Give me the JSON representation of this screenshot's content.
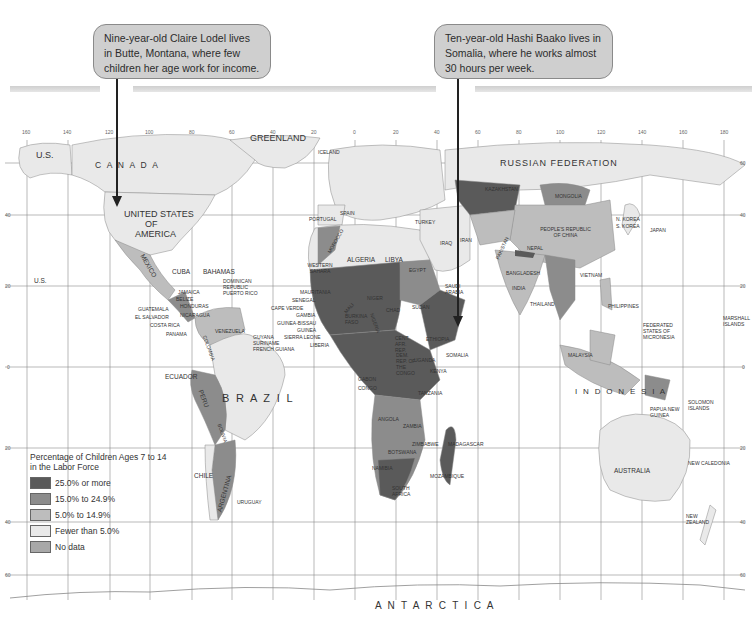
{
  "callouts": [
    {
      "text": "Nine-year-old Claire Lodel lives in Butte, Montana, where few children her age work for income.",
      "points_to": "United States of America"
    },
    {
      "text": "Ten-year-old Hashi Baako lives in Somalia, where he works almost 30 hours per week.",
      "points_to": "Somalia"
    }
  ],
  "legend": {
    "title": "Percentage of Children Ages 7 to 14 in the Labor Force",
    "items": [
      {
        "label": "25.0% or more",
        "color": "#5a5a5a"
      },
      {
        "label": "15.0% to 24.9%",
        "color": "#8c8c8c"
      },
      {
        "label": "5.0% to 14.9%",
        "color": "#bdbdbd"
      },
      {
        "label": "Fewer than 5.0%",
        "color": "#e9e9e9"
      },
      {
        "label": "No data",
        "color": "#a8a8a8"
      }
    ]
  },
  "grid": {
    "longitude_ticks": [
      "160",
      "140",
      "120",
      "100",
      "80",
      "60",
      "40",
      "20",
      "0",
      "20",
      "40",
      "60",
      "80",
      "100",
      "120",
      "140",
      "160",
      "180"
    ],
    "latitude_ticks_right": [
      "60",
      "40",
      "20",
      "0",
      "20",
      "40",
      "60"
    ],
    "latitude_ticks_left": [
      "40",
      "20",
      "0",
      "20",
      "40",
      "60"
    ]
  },
  "labels": {
    "us_alaska": "U.S.",
    "canada": "C A N A D A",
    "greenland": "GREENLAND",
    "iceland": "ICELAND",
    "usa_1": "UNITED STATES",
    "usa_2": "OF",
    "usa_3": "AMERICA",
    "mexico": "MEXICO",
    "us_hawaii": "U.S.",
    "cuba": "CUBA",
    "bahamas": "BAHAMAS",
    "dominican": "DOMINICAN REPUBLIC",
    "puerto_rico": "PUERTO RICO",
    "jamaica": "JAMAICA",
    "belize": "BELIZE",
    "honduras": "HONDURAS",
    "guatemala": "GUATEMALA",
    "el_salvador": "EL SALVADOR",
    "nicaragua": "NICARAGUA",
    "costa_rica": "COSTA RICA",
    "panama": "PANAMA",
    "venezuela": "VENEZUELA",
    "guyana": "GUYANA",
    "suriname": "SURINAME",
    "french_guiana": "FRENCH GUIANA",
    "colombia": "COLOMBIA",
    "ecuador": "ECUADOR",
    "brazil": "B R A Z I L",
    "peru": "PERU",
    "bolivia": "BOLIVIA",
    "chile": "CHILE",
    "argentina": "ARGENTINA",
    "uruguay": "URUGUAY",
    "portugal": "PORTUGAL",
    "spain": "SPAIN",
    "morocco": "MOROCCO",
    "western_sahara": "WESTERN SAHARA",
    "algeria": "ALGERIA",
    "libya": "LIBYA",
    "egypt": "EGYPT",
    "mauritania": "MAURITANIA",
    "senegal": "SENEGAL",
    "cape_verde": "CAPE VERDE",
    "gambia": "GAMBIA",
    "guinea_bissau": "GUINEA-BISSAU",
    "guinea": "GUINEA",
    "sierra_leone": "SIERRA LEONE",
    "liberia": "LIBERIA",
    "mali": "MALI",
    "niger": "NIGER",
    "chad": "CHAD",
    "sudan": "SUDAN",
    "burkina": "BURKINA FASO",
    "nigeria": "NIGERIA",
    "cent_afr": "CENT. AFR. REP.",
    "ethiopia": "ETHIOPIA",
    "somalia": "SOMALIA",
    "kenya": "KENYA",
    "uganda": "UGANDA",
    "dem_rep_congo": "DEM. REP. OF THE CONGO",
    "gabon": "GABON",
    "congo": "CONGO",
    "tanzania": "TANZANIA",
    "angola": "ANGOLA",
    "zambia": "ZAMBIA",
    "zimbabwe": "ZIMBABWE",
    "botswana": "BOTSWANA",
    "namibia": "NAMIBIA",
    "mozambique": "MOZAMBIQUE",
    "south_africa": "SOUTH AFRICA",
    "madagascar": "MADAGASCAR",
    "russia": "RUSSIAN   FEDERATION",
    "kazakhstan": "KAZAKHSTAN",
    "mongolia": "MONGOLIA",
    "china": "PEOPLE'S REPUBLIC OF CHINA",
    "japan": "JAPAN",
    "n_korea": "N. KOREA",
    "s_korea": "S. KOREA",
    "turkey": "TURKEY",
    "iran": "IRAN",
    "iraq": "IRAQ",
    "saudi": "SAUDI ARABIA",
    "pakistan": "PAKISTAN",
    "india": "INDIA",
    "nepal": "NEPAL",
    "bangladesh": "BANGLADESH",
    "thailand": "THAILAND",
    "vietnam": "VIETNAM",
    "philippines": "PHILIPPINES",
    "malaysia": "MALAYSIA",
    "indonesia": "I N D O N E S I A",
    "png": "PAPUA NEW GUINEA",
    "australia": "AUSTRALIA",
    "new_zealand": "NEW ZEALAND",
    "antarctica": "A N T A R C T I C A",
    "micronesia": "FEDERATED STATES OF MICRONESIA",
    "marshall": "MARSHALL ISLANDS",
    "solomon": "SOLOMON ISLANDS",
    "new_caledonia": "NEW CALEDONIA"
  },
  "colors": {
    "water": "#ffffff",
    "grid": "#8a8a8a",
    "land_low": "#e9e9e9",
    "land_mid": "#bdbdbd",
    "land_high": "#8c8c8c",
    "land_top": "#5a5a5a",
    "callout_bg": "#cfcfcf"
  }
}
